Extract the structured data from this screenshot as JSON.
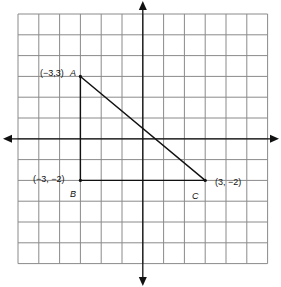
{
  "diagram": {
    "type": "coordinate-plane",
    "grid": {
      "x_min": -6,
      "x_max": 6,
      "y_min": -6,
      "y_max": 6,
      "cell_px": 20.8
    },
    "axes": {
      "x_arrows": true,
      "y_arrows": true
    },
    "colors": {
      "grid": "#8a8a8a",
      "axis": "#111111",
      "shape": "#111111"
    },
    "triangle": {
      "vertices": [
        {
          "name": "A",
          "x": -3,
          "y": 3,
          "coord_label": "(−3,3)"
        },
        {
          "name": "B",
          "x": -3,
          "y": -2,
          "coord_label": "(−3, −2)"
        },
        {
          "name": "C",
          "x": 3,
          "y": -2,
          "coord_label": "(3, −2)"
        }
      ]
    }
  }
}
